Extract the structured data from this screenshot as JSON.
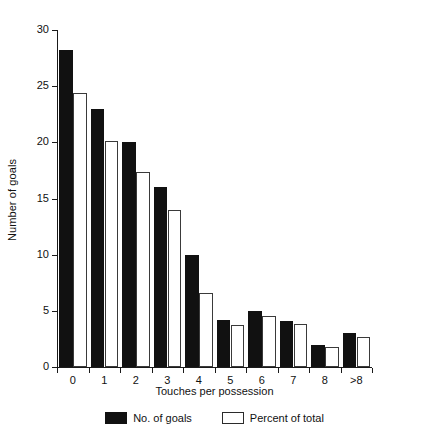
{
  "chart_data": {
    "type": "bar",
    "title": "",
    "xlabel": "Touches per possession",
    "ylabel": "Number of goals",
    "categories": [
      "0",
      "1",
      "2",
      "3",
      "4",
      "5",
      "6",
      "7",
      "8",
      ">8"
    ],
    "series": [
      {
        "name": "No. of goals",
        "color": "#111111",
        "fill": "solid-black",
        "values": [
          28.2,
          23.0,
          20.0,
          16.0,
          10.0,
          4.2,
          5.0,
          4.1,
          2.0,
          3.0
        ]
      },
      {
        "name": "Percent of total",
        "color": "#ffffff",
        "fill": "open-white",
        "values": [
          24.4,
          20.1,
          17.4,
          14.0,
          6.6,
          3.7,
          4.5,
          3.8,
          1.8,
          2.7
        ]
      }
    ],
    "ylim": [
      0,
      30
    ],
    "yticks": [
      0,
      5,
      10,
      15,
      20,
      25,
      30
    ],
    "ytick_labels": [
      "0",
      "5",
      "10",
      "15",
      "20",
      "25",
      "30"
    ],
    "grid": false,
    "legend_position": "bottom-center"
  },
  "legend": {
    "entries": [
      {
        "label": "No. of goals",
        "swatch": "filled-black-square"
      },
      {
        "label": "Percent of total",
        "swatch": "open-white-square"
      }
    ]
  },
  "axes": {
    "y_title": "Number of goals",
    "x_title": "Touches per possession"
  }
}
